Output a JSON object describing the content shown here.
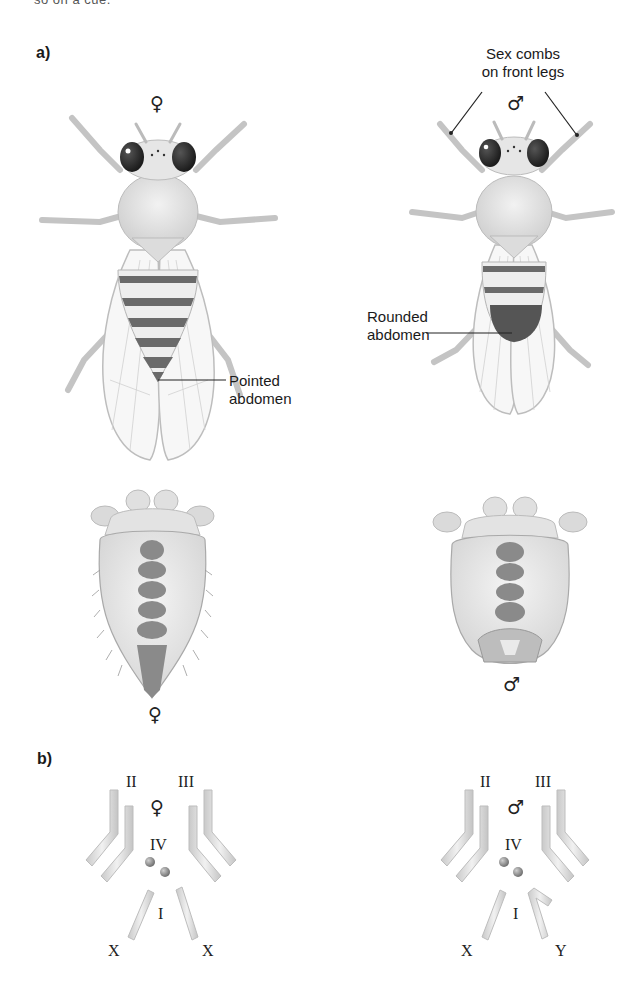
{
  "page": {
    "cut_off_text": "so on a cue.",
    "panel_a": {
      "label": "a)",
      "female_symbol": "♀",
      "male_symbol": "♂",
      "callouts": {
        "sex_combs": [
          "Sex combs",
          "on front legs"
        ],
        "pointed_abdomen": [
          "Pointed",
          "abdomen"
        ],
        "rounded_abdomen": [
          "Rounded",
          "abdomen"
        ]
      },
      "ventral_female_symbol": "♀",
      "ventral_male_symbol": "♂"
    },
    "panel_b": {
      "label": "b)",
      "female": {
        "symbol": "♀",
        "chromosome_labels": {
          "ii": "II",
          "iii": "III",
          "iv": "IV",
          "i": "I",
          "left_sex": "X",
          "right_sex": "X"
        }
      },
      "male": {
        "symbol": "♂",
        "chromosome_labels": {
          "ii": "II",
          "iii": "III",
          "iv": "IV",
          "i": "I",
          "left_sex": "X",
          "right_sex": "Y"
        }
      }
    },
    "colors": {
      "body_fill": "#e4e4e4",
      "body_stroke": "#b5b5b5",
      "band_dark": "#666666",
      "eye": "#2a2a2a",
      "chromosome": "#d9d9d9",
      "text": "#1a1a1a"
    }
  }
}
